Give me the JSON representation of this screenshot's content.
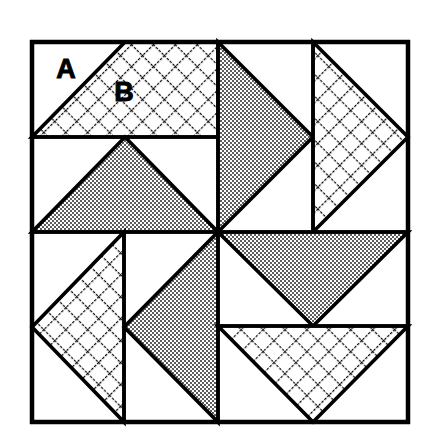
{
  "figure": {
    "kind": "quilt-block-diagram",
    "title_visible": false,
    "background_color": "#ffffff",
    "line_color": "#000000",
    "shade_color": "#9a9a9a",
    "hatch_color": "#000000",
    "outer_border_width": 4,
    "inner_line_width": 3.5,
    "frame": {
      "x": 32,
      "y": 42,
      "width": 376,
      "height": 380
    },
    "center": {
      "x": 218,
      "y": 232
    }
  },
  "labels": [
    {
      "id": "label-a",
      "text": "A",
      "x": 66,
      "y": 78,
      "describes": "plain background patch"
    },
    {
      "id": "label-b",
      "text": "B",
      "x": 124,
      "y": 101,
      "describes": "cross-hatched triangle patch"
    }
  ],
  "patches": {
    "top_left": {
      "name": "top-left-quadrant",
      "divider": {
        "orientation": "horizontal",
        "y": 137
      },
      "units": [
        {
          "id": "tl-hatch-triangle",
          "fill": "crosshatch",
          "points": "32,137 218,137 218,42 125,42",
          "shape": "triangle-up"
        },
        {
          "id": "tl-shade-triangle",
          "fill": "shade",
          "points": "32,232 218,232 125,137",
          "shape": "triangle-up"
        }
      ]
    },
    "top_right": {
      "name": "top-right-quadrant",
      "divider": {
        "orientation": "vertical",
        "x": 313
      },
      "units": [
        {
          "id": "tr-shade-triangle",
          "fill": "shade",
          "points": "218,42 313,137 218,232",
          "shape": "triangle-right"
        },
        {
          "id": "tr-hatch-triangle",
          "fill": "crosshatch",
          "points": "313,42 408,137 313,232",
          "shape": "triangle-right"
        }
      ]
    },
    "bottom_left": {
      "name": "bottom-left-quadrant",
      "divider": {
        "orientation": "vertical",
        "x": 124
      },
      "units": [
        {
          "id": "bl-hatch-triangle",
          "fill": "crosshatch",
          "points": "124,232 124,422 32,327",
          "shape": "triangle-left"
        },
        {
          "id": "bl-shade-triangle",
          "fill": "shade",
          "points": "218,232 218,422 124,327",
          "shape": "triangle-left"
        }
      ]
    },
    "bottom_right": {
      "name": "bottom-right-quadrant",
      "divider": {
        "orientation": "horizontal",
        "y": 326
      },
      "units": [
        {
          "id": "br-shade-triangle",
          "fill": "shade",
          "points": "218,232 408,232 313,326",
          "shape": "triangle-down"
        },
        {
          "id": "br-hatch-triangle",
          "fill": "crosshatch",
          "points": "218,326 408,326 313,422",
          "shape": "triangle-down"
        }
      ]
    }
  },
  "legend": {
    "a_meaning": "A",
    "b_meaning": "B"
  }
}
